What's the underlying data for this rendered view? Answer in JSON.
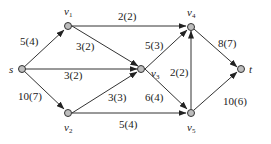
{
  "diagram": {
    "type": "flow-network",
    "nodes": [
      {
        "id": "s",
        "label": "s",
        "sub": ""
      },
      {
        "id": "v1",
        "label": "v",
        "sub": "1"
      },
      {
        "id": "v2",
        "label": "v",
        "sub": "2"
      },
      {
        "id": "v3",
        "label": "v",
        "sub": "3"
      },
      {
        "id": "v4",
        "label": "v",
        "sub": "4"
      },
      {
        "id": "v5",
        "label": "v",
        "sub": "5"
      },
      {
        "id": "t",
        "label": "t",
        "sub": ""
      }
    ],
    "edges": [
      {
        "from": "s",
        "to": "v1",
        "label": "5(4)"
      },
      {
        "from": "s",
        "to": "v3",
        "label": "3(2)"
      },
      {
        "from": "s",
        "to": "v2",
        "label": "10(7)"
      },
      {
        "from": "v1",
        "to": "v4",
        "label": "2(2)"
      },
      {
        "from": "v1",
        "to": "v3",
        "label": "3(2)"
      },
      {
        "from": "v2",
        "to": "v3",
        "label": "3(3)"
      },
      {
        "from": "v2",
        "to": "v5",
        "label": "5(4)"
      },
      {
        "from": "v3",
        "to": "v4",
        "label": "5(3)"
      },
      {
        "from": "v3",
        "to": "v5",
        "label": "6(4)"
      },
      {
        "from": "v5",
        "to": "v4",
        "label": "2(2)"
      },
      {
        "from": "v4",
        "to": "t",
        "label": "8(7)"
      },
      {
        "from": "v5",
        "to": "t",
        "label": "10(6)"
      }
    ]
  }
}
